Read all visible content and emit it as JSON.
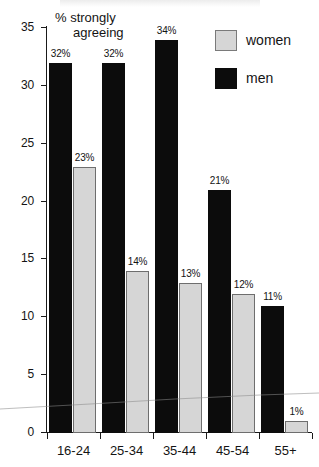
{
  "chart_data": {
    "type": "bar",
    "title": "",
    "xlabel": "",
    "ylabel": "% strongly agreeing",
    "ylabel_line1": "% strongly",
    "ylabel_line2": "agreeing",
    "ylim": [
      0,
      35
    ],
    "ytick_values": [
      0,
      5,
      10,
      15,
      20,
      25,
      30,
      35
    ],
    "ytick_labels": [
      "0",
      "5",
      "10",
      "15",
      "20",
      "25",
      "30",
      "35"
    ],
    "grid": false,
    "legend_position": "top-right",
    "categories": [
      "16-24",
      "25-34",
      "35-44",
      "45-54",
      "55+"
    ],
    "series": [
      {
        "name": "men",
        "color": "#0c0c0c",
        "values": [
          32,
          32,
          34,
          21,
          11
        ],
        "data_labels": [
          "32%",
          "32%",
          "34%",
          "21%",
          "11%"
        ]
      },
      {
        "name": "women",
        "color": "#d6d6d6",
        "values": [
          23,
          14,
          13,
          12,
          1
        ],
        "data_labels": [
          "23%",
          "14%",
          "13%",
          "12%",
          "1%"
        ]
      }
    ]
  },
  "legend": {
    "items": [
      {
        "label": "women",
        "swatch": "women"
      },
      {
        "label": "men",
        "swatch": "men"
      }
    ]
  }
}
